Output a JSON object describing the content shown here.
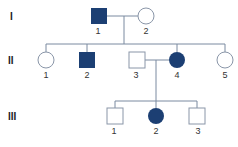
{
  "diagram": {
    "type": "pedigree",
    "colors": {
      "affected": "#1c3f73",
      "line": "#7a8aa0",
      "unaffected_stroke": "#8a96a8"
    },
    "generations": [
      {
        "label": "I",
        "members": [
          {
            "id": "1",
            "sex": "male",
            "affected": true
          },
          {
            "id": "2",
            "sex": "female",
            "affected": false
          }
        ]
      },
      {
        "label": "II",
        "members": [
          {
            "id": "1",
            "sex": "female",
            "affected": false
          },
          {
            "id": "2",
            "sex": "male",
            "affected": true
          },
          {
            "id": "3",
            "sex": "male",
            "affected": false
          },
          {
            "id": "4",
            "sex": "female",
            "affected": true
          },
          {
            "id": "5",
            "sex": "female",
            "affected": false
          }
        ]
      },
      {
        "label": "III",
        "members": [
          {
            "id": "1",
            "sex": "male",
            "affected": false
          },
          {
            "id": "2",
            "sex": "female",
            "affected": true
          },
          {
            "id": "3",
            "sex": "male",
            "affected": false
          }
        ]
      }
    ],
    "unions": [
      {
        "partners": [
          "I-1",
          "I-2"
        ],
        "children": [
          "II-1",
          "II-2",
          "II-4",
          "II-5"
        ]
      },
      {
        "partners": [
          "II-3",
          "II-4"
        ],
        "children": [
          "III-1",
          "III-2",
          "III-3"
        ]
      }
    ]
  }
}
